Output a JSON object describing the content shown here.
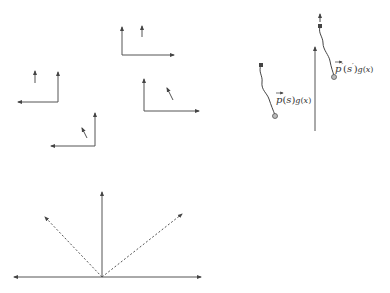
{
  "colors": {
    "stroke": "#555555",
    "background": "#ffffff"
  },
  "frames": [
    {
      "id": "frame-a",
      "corner": [
        122,
        55
      ],
      "up_to": [
        122,
        27
      ],
      "side_to": [
        174,
        55
      ],
      "small": [
        [
          142,
          37
        ],
        [
          142,
          26
        ]
      ]
    },
    {
      "id": "frame-b",
      "corner": [
        58,
        102
      ],
      "up_to": [
        58,
        72
      ],
      "side_to": [
        18,
        102
      ],
      "small": [
        [
          35,
          83
        ],
        [
          35,
          71
        ]
      ]
    },
    {
      "id": "frame-c",
      "corner": [
        144,
        111
      ],
      "up_to": [
        144,
        79
      ],
      "side_to": [
        199,
        111
      ],
      "small": [
        [
          173,
          100
        ],
        [
          167,
          88
        ]
      ]
    },
    {
      "id": "frame-d",
      "corner": [
        95,
        146
      ],
      "up_to": [
        95,
        113
      ],
      "side_to": [
        51,
        146
      ],
      "small": [
        [
          87,
          138
        ],
        [
          82,
          128
        ]
      ]
    }
  ],
  "path_diagram": {
    "axis": {
      "from": [
        315,
        131
      ],
      "to": [
        315,
        47
      ]
    },
    "path_left": {
      "label": "p(s)g(x)",
      "label_pos": [
        269,
        103
      ]
    },
    "path_right": {
      "label": "p'(s')g(x)",
      "label_pos": [
        334,
        72
      ]
    }
  },
  "bottom_diagram": {
    "baseline_from": [
      14,
      277
    ],
    "baseline_to": [
      201,
      277
    ],
    "origin": [
      102,
      277
    ],
    "vertical_to": [
      102,
      192
    ],
    "dashed_left_to": [
      45,
      217
    ],
    "dashed_right_to": [
      182,
      214
    ]
  }
}
